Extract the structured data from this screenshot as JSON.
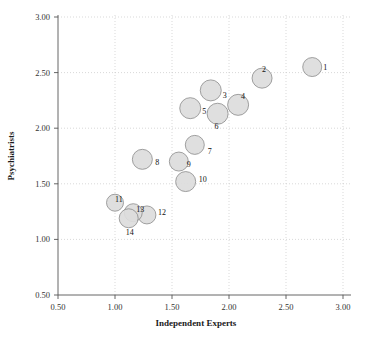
{
  "chart_data": {
    "type": "scatter",
    "title": "",
    "xlabel": "Independent Experts",
    "ylabel": "Psychiatrists",
    "xlim": [
      0.5,
      3.0
    ],
    "ylim": [
      0.5,
      3.0
    ],
    "xticks": [
      "0.50",
      "1.00",
      "1.50",
      "2.00",
      "2.50",
      "3.00"
    ],
    "xtick_values": [
      0.5,
      1.0,
      1.5,
      2.0,
      2.5,
      3.0
    ],
    "yticks": [
      "0.50",
      "1.00",
      "1.50",
      "2.00",
      "2.50",
      "3.00"
    ],
    "ytick_values": [
      0.5,
      1.0,
      1.5,
      2.0,
      2.5,
      3.0
    ],
    "grid": true,
    "legend": "none",
    "marker_style": "filled-circle",
    "marker_fill": "#dcdcdc",
    "marker_stroke": "#8a8a8a",
    "points": [
      {
        "label": "1",
        "x": 2.73,
        "y": 2.55,
        "r": 9.5,
        "label_dx": 11,
        "label_dy": 0
      },
      {
        "label": "2",
        "x": 2.29,
        "y": 2.45,
        "r": 10.0,
        "label_dx": 0,
        "label_dy": -9
      },
      {
        "label": "3",
        "x": 1.84,
        "y": 2.34,
        "r": 10.5,
        "label_dx": 12,
        "label_dy": 5
      },
      {
        "label": "4",
        "x": 2.08,
        "y": 2.21,
        "r": 10.5,
        "label_dx": 3,
        "label_dy": -9
      },
      {
        "label": "5",
        "x": 1.66,
        "y": 2.18,
        "r": 10.5,
        "label_dx": 12,
        "label_dy": 3
      },
      {
        "label": "6",
        "x": 1.9,
        "y": 2.13,
        "r": 10.5,
        "label_dx": -3,
        "label_dy": 12
      },
      {
        "label": "7",
        "x": 1.7,
        "y": 1.85,
        "r": 9.5,
        "label_dx": 13,
        "label_dy": 6
      },
      {
        "label": "8",
        "x": 1.24,
        "y": 1.72,
        "r": 10.0,
        "label_dx": 13,
        "label_dy": 3
      },
      {
        "label": "9",
        "x": 1.56,
        "y": 1.7,
        "r": 9.5,
        "label_dx": 8,
        "label_dy": 2
      },
      {
        "label": "10",
        "x": 1.62,
        "y": 1.52,
        "r": 10.0,
        "label_dx": 13,
        "label_dy": -3
      },
      {
        "label": "11",
        "x": 1.0,
        "y": 1.33,
        "r": 8.5,
        "label_dx": 0,
        "label_dy": -4
      },
      {
        "label": "12",
        "x": 1.28,
        "y": 1.22,
        "r": 9.0,
        "label_dx": 11,
        "label_dy": -3
      },
      {
        "label": "13",
        "x": 1.16,
        "y": 1.24,
        "r": 9.0,
        "label_dx": 3,
        "label_dy": -4
      },
      {
        "label": "14",
        "x": 1.12,
        "y": 1.19,
        "r": 9.5,
        "label_dx": -3,
        "label_dy": 14
      }
    ]
  },
  "axes": {
    "x_title": "Independent Experts",
    "y_title": "Psychiatrists"
  }
}
